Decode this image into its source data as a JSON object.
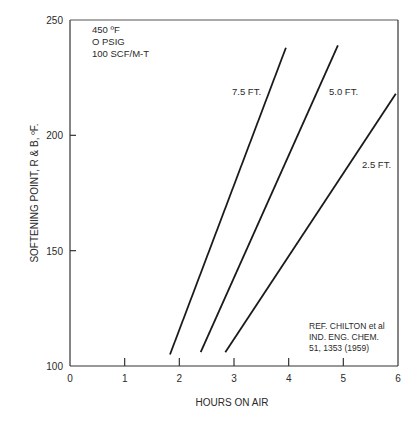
{
  "chart_data": {
    "type": "line",
    "title": "",
    "xlabel": "HOURS ON AIR",
    "ylabel": "SOFTENING POINT, R & B, ºF.",
    "xlim": [
      0,
      6
    ],
    "ylim": [
      100,
      250
    ],
    "x_ticks": [
      0,
      1,
      2,
      3,
      4,
      5,
      6
    ],
    "x_tick_labels": [
      "0",
      "1",
      "2",
      "3",
      "4",
      "5",
      "6"
    ],
    "y_ticks": [
      100,
      150,
      200,
      250
    ],
    "y_tick_labels": [
      "100",
      "150",
      "200",
      "250"
    ],
    "grid": false,
    "legend": "inline labels next to lines",
    "series": [
      {
        "name": "7.5 FT.",
        "x": [
          1.83,
          3.95
        ],
        "y": [
          105,
          238
        ]
      },
      {
        "name": "5.0 FT.",
        "x": [
          2.39,
          4.9
        ],
        "y": [
          106,
          239
        ]
      },
      {
        "name": "2.5 FT.",
        "x": [
          2.84,
          5.96
        ],
        "y": [
          106,
          218
        ]
      }
    ],
    "annotations": {
      "conditions": [
        "450 ºF",
        "O PSIG",
        "100 SCF/M-T"
      ],
      "reference": [
        "REF. CHILTON et al",
        "IND. ENG. CHEM.",
        "51, 1353 (1959)"
      ]
    }
  },
  "labels": {
    "series_7_5": "7.5 FT.",
    "series_5_0": "5.0 FT.",
    "series_2_5": "2.5 FT.",
    "cond_1": "450 ºF",
    "cond_2": "O PSIG",
    "cond_3": "100 SCF/M-T",
    "ref_1": "REF. CHILTON et al",
    "ref_2": "IND. ENG. CHEM.",
    "ref_3": "51, 1353 (1959)",
    "xlabel": "HOURS ON AIR",
    "ylabel": "SOFTENING POINT, R & B, ºF."
  },
  "colors": {
    "line": "#1a1a1a",
    "axis": "#333333",
    "text": "#2a2a2a",
    "background": "#ffffff"
  }
}
